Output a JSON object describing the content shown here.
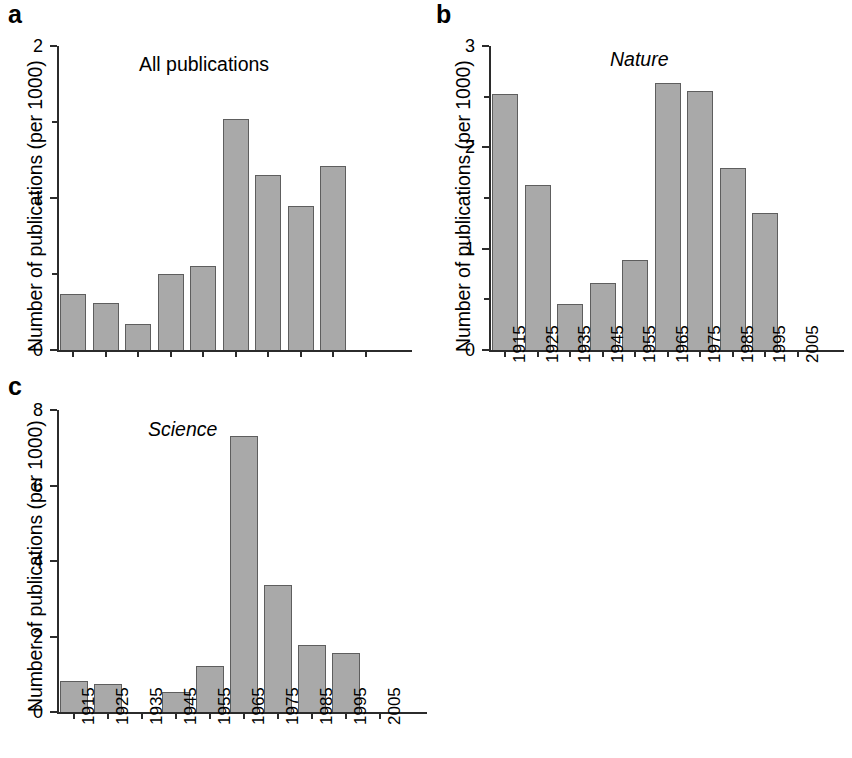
{
  "figure": {
    "background": "#ffffff",
    "bar_fill": "#a9a9a9",
    "bar_stroke": "#5e5e5e",
    "axis_color": "#2b2b2b"
  },
  "panels": [
    {
      "letter": "a",
      "title": "All publications",
      "title_italic": false,
      "ylabel": "Number of publications (per 1000)",
      "show_xticklabels": false
    },
    {
      "letter": "b",
      "title": "Nature",
      "title_italic": true,
      "ylabel": "Number of publications (per 1000)",
      "show_xticklabels": true
    },
    {
      "letter": "c",
      "title": "Science",
      "title_italic": true,
      "ylabel": "Number of publications (per 1000)",
      "show_xticklabels": true
    }
  ],
  "chart_data": [
    {
      "type": "bar",
      "panel": "a",
      "title": "All publications",
      "xlabel": "",
      "ylabel": "Number of publications (per 1000)",
      "categories": [
        "1915",
        "1925",
        "1935",
        "1945",
        "1955",
        "1965",
        "1975",
        "1985",
        "1995",
        "2005"
      ],
      "values": [
        0.37,
        0.31,
        0.17,
        0.5,
        0.55,
        1.52,
        1.15,
        0.95,
        1.21,
        0
      ],
      "ylim": [
        0,
        2
      ],
      "yticks": [
        0,
        1,
        2
      ],
      "yticklabels": [
        "0",
        "1",
        "2"
      ],
      "yminorticks": [
        0.5,
        1.5
      ],
      "grid": false,
      "legend": "none"
    },
    {
      "type": "bar",
      "panel": "b",
      "title": "Nature",
      "xlabel": "",
      "ylabel": "Number of publications (per 1000)",
      "categories": [
        "1915",
        "1925",
        "1935",
        "1945",
        "1955",
        "1965",
        "1975",
        "1985",
        "1995",
        "2005"
      ],
      "values": [
        2.53,
        1.63,
        0.45,
        0.66,
        0.89,
        2.63,
        2.56,
        1.8,
        1.35,
        0
      ],
      "ylim": [
        0,
        3
      ],
      "yticks": [
        0,
        1,
        2,
        3
      ],
      "yticklabels": [
        "0",
        "1",
        "2",
        "3"
      ],
      "yminorticks": [
        0.5,
        1.5,
        2.5
      ],
      "grid": false,
      "legend": "none"
    },
    {
      "type": "bar",
      "panel": "c",
      "title": "Science",
      "xlabel": "",
      "ylabel": "Number of publications (per 1000)",
      "categories": [
        "1915",
        "1925",
        "1935",
        "1945",
        "1955",
        "1965",
        "1975",
        "1985",
        "1995",
        "2005"
      ],
      "values": [
        0.82,
        0.75,
        0,
        0.52,
        1.23,
        7.3,
        3.37,
        1.78,
        1.57,
        0
      ],
      "ylim": [
        0,
        8
      ],
      "yticks": [
        0,
        2,
        4,
        6,
        8
      ],
      "yticklabels": [
        "0",
        "2",
        "4",
        "6",
        "8"
      ],
      "yminorticks": [],
      "grid": false,
      "legend": "none"
    }
  ]
}
